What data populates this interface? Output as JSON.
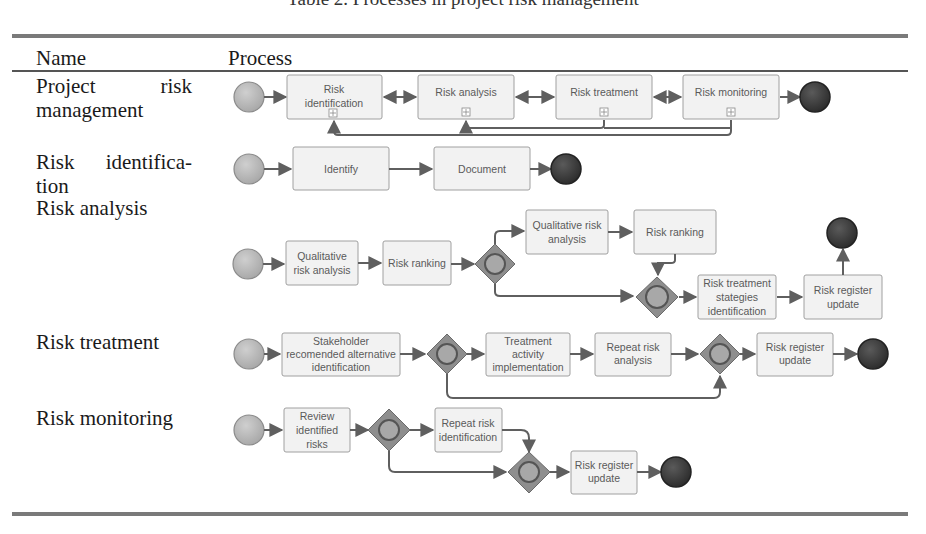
{
  "caption": "Table 2. Processes in project risk management",
  "table": {
    "headers": [
      "Name",
      "Process"
    ],
    "rows": [
      {
        "name_line1": "Project risk",
        "name_line2": "management",
        "process": {
          "start": "start-event",
          "tasks": [
            "Risk identification",
            "Risk analysis",
            "Risk treatment",
            "Risk monitoring"
          ],
          "task_marker": "subprocess-plus-icon",
          "end": "end-event",
          "connections": "bidirectional between consecutive tasks; feedback loops from Risk treatment and Risk monitoring back to Risk identification and Risk analysis"
        }
      },
      {
        "name_line1": "Risk identifica-",
        "name_line2": "tion",
        "process": {
          "tasks": [
            "Identify",
            "Document"
          ]
        }
      },
      {
        "name_line1": "Risk analysis",
        "process": {
          "tasks": [
            "Qualitative risk analysis",
            "Risk ranking",
            "Qualitative risk analysis",
            "Risk ranking",
            "Risk treatment stategies identification",
            "Risk register update"
          ],
          "gateways": 2
        }
      },
      {
        "name_line1": "Risk treatment",
        "process": {
          "tasks": [
            "Stakeholder recomended alternative identification",
            "Treatment activity implementation",
            "Repeat risk analysis",
            "Risk register update"
          ],
          "gateways": 2
        }
      },
      {
        "name_line1": "Risk monitoring",
        "process": {
          "tasks": [
            "Review identified risks",
            "Repeat risk identification",
            "Risk register update"
          ],
          "gateways": 2
        }
      }
    ]
  },
  "labels": {
    "r1": {
      "t1a": "Risk",
      "t1b": "identification",
      "t2": "Risk analysis",
      "t3": "Risk treatment",
      "t4": "Risk monitoring"
    },
    "r2": {
      "t1": "Identify",
      "t2": "Document"
    },
    "r3": {
      "t1a": "Qualitative",
      "t1b": "risk analysis",
      "t2": "Risk ranking",
      "t3a": "Qualitative risk",
      "t3b": "analysis",
      "t4": "Risk ranking",
      "t5a": "Risk treatment",
      "t5b": "stategies",
      "t5c": "identification",
      "t6a": "Risk register",
      "t6b": "update"
    },
    "r4": {
      "t1a": "Stakeholder",
      "t1b": "recomended alternative",
      "t1c": "identification",
      "t2a": "Treatment",
      "t2b": "activity",
      "t2c": "implementation",
      "t3a": "Repeat risk",
      "t3b": "analysis",
      "t4a": "Risk register",
      "t4b": "update"
    },
    "r5": {
      "t1a": "Review",
      "t1b": "identified",
      "t1c": "risks",
      "t2a": "Repeat risk",
      "t2b": "identification",
      "t3a": "Risk register",
      "t3b": "update"
    }
  },
  "colors": {
    "start_event": "#b3b3b3",
    "end_event": "#3a3a3a",
    "gateway": "#8c8c8c",
    "task_fill": "#f2f2f2",
    "task_border": "#9a9a9a",
    "connector": "#5f5f5f",
    "rule": "#7a7a7a"
  }
}
